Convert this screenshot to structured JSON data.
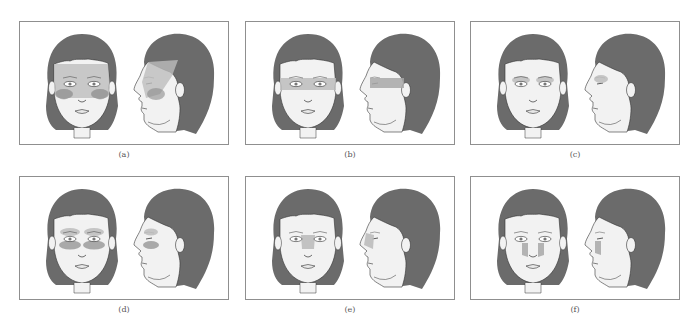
{
  "figure": {
    "colors": {
      "hair": "#6b6b6b",
      "skin": "#f2f2f2",
      "outline": "#333333",
      "shade_light": "#bdbdbd",
      "shade_dark": "#8a8a8a",
      "frame": "#8f8f8f"
    },
    "panels": [
      {
        "id": "a",
        "label": "(a)",
        "shaded_region": "forehead, temples, cheeks and upper face"
      },
      {
        "id": "b",
        "label": "(b)",
        "shaded_region": "horizontal band across eyes to ear"
      },
      {
        "id": "c",
        "label": "(c)",
        "shaded_region": "eyebrows / above eyes"
      },
      {
        "id": "d",
        "label": "(d)",
        "shaded_region": "above and below eyes"
      },
      {
        "id": "e",
        "label": "(e)",
        "shaded_region": "bridge of nose"
      },
      {
        "id": "f",
        "label": "(f)",
        "shaded_region": "sides of nose"
      }
    ]
  }
}
